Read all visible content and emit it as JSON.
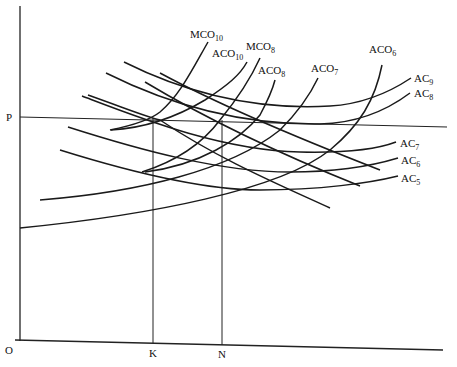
{
  "diagram": {
    "axis_labels": {
      "origin": "O",
      "price": "P",
      "quantity_k": "K",
      "quantity_n": "N"
    },
    "ac_curves": [
      {
        "id": "AC9",
        "base": "AC",
        "sub": "9"
      },
      {
        "id": "AC8",
        "base": "AC",
        "sub": "8"
      },
      {
        "id": "AC7",
        "base": "AC",
        "sub": "7"
      },
      {
        "id": "AC6",
        "base": "AC",
        "sub": "6"
      },
      {
        "id": "AC5",
        "base": "AC",
        "sub": "5"
      }
    ],
    "aco_curves": [
      {
        "id": "ACO10",
        "base": "ACO",
        "sub": "10"
      },
      {
        "id": "ACO8",
        "base": "ACO",
        "sub": "8"
      },
      {
        "id": "ACO7",
        "base": "ACO",
        "sub": "7"
      },
      {
        "id": "ACO6",
        "base": "ACO",
        "sub": "6"
      }
    ],
    "mco_curves": [
      {
        "id": "MCO10",
        "base": "MCO",
        "sub": "10"
      },
      {
        "id": "MCO8",
        "base": "MCO",
        "sub": "8"
      }
    ]
  }
}
